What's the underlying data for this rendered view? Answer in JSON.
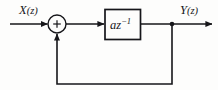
{
  "diagram": {
    "type": "block-diagram",
    "background_color": "#fdfdfc",
    "line_color": "#16161a",
    "input": {
      "label": "X(z)",
      "label_main": "X",
      "label_arg": "(z)"
    },
    "output": {
      "label": "Y(z)",
      "label_main": "Y",
      "label_arg": "(z)"
    },
    "summing_junction": {
      "name": "adder",
      "sign": "+",
      "shape": "circle"
    },
    "block": {
      "name": "gain-delay-block",
      "label": "az⁻¹",
      "label_base": "az",
      "label_exponent": "−1",
      "shape": "rectangle"
    },
    "nodes": {
      "output_tap": "junction-dot"
    },
    "paths": [
      "input-to-adder",
      "adder-to-block",
      "block-to-output",
      "feedback-output-to-adder"
    ]
  }
}
